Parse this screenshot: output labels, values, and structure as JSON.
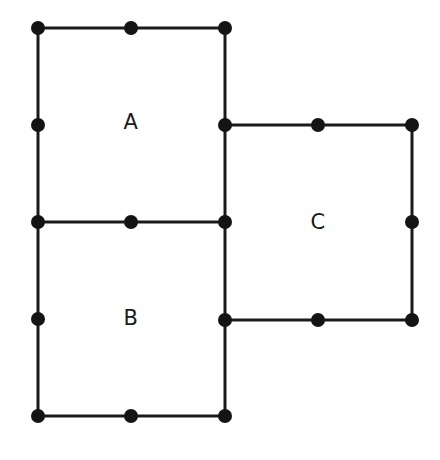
{
  "figure": {
    "background_color": "#ffffff",
    "line_color": "#1a1a1a",
    "dot_color": "#141414",
    "label_color": "#1a1a1a",
    "line_width": 3,
    "dot_radius": 7,
    "canvas": {
      "width": 440,
      "height": 460
    }
  },
  "squares": [
    {
      "id": "square-a",
      "label": "A",
      "x": 38,
      "y": 28,
      "size": 194,
      "label_x": 131,
      "label_y": 123
    },
    {
      "id": "square-b",
      "label": "B",
      "x": 38,
      "y": 222,
      "size": 194,
      "label_x": 131,
      "label_y": 319
    },
    {
      "id": "square-c",
      "label": "C",
      "x": 225,
      "y": 125,
      "size": 195,
      "label_x": 318,
      "label_y": 223
    }
  ],
  "segments": [
    {
      "name": "square-a-top-edge",
      "x1": 38,
      "y1": 28,
      "x2": 225,
      "y2": 28
    },
    {
      "name": "square-a-left-edge",
      "x1": 38,
      "y1": 28,
      "x2": 38,
      "y2": 222
    },
    {
      "name": "square-a-right-edge",
      "x1": 225,
      "y1": 28,
      "x2": 225,
      "y2": 222
    },
    {
      "name": "square-a-bottom-edge",
      "x1": 38,
      "y1": 222,
      "x2": 225,
      "y2": 222
    },
    {
      "name": "square-b-left-edge",
      "x1": 38,
      "y1": 222,
      "x2": 38,
      "y2": 416
    },
    {
      "name": "square-b-right-edge",
      "x1": 225,
      "y1": 222,
      "x2": 225,
      "y2": 416
    },
    {
      "name": "square-b-bottom-edge",
      "x1": 38,
      "y1": 416,
      "x2": 225,
      "y2": 416
    },
    {
      "name": "square-c-top-edge",
      "x1": 225,
      "y1": 125,
      "x2": 412,
      "y2": 125
    },
    {
      "name": "square-c-right-edge",
      "x1": 412,
      "y1": 125,
      "x2": 412,
      "y2": 320
    },
    {
      "name": "square-c-bottom-edge",
      "x1": 225,
      "y1": 320,
      "x2": 412,
      "y2": 320
    }
  ],
  "dots": [
    {
      "name": "vertex-a-top-left",
      "x": 38,
      "y": 28
    },
    {
      "name": "midpoint-a-top",
      "x": 131,
      "y": 28
    },
    {
      "name": "vertex-a-top-right",
      "x": 225,
      "y": 28
    },
    {
      "name": "midpoint-a-left",
      "x": 38,
      "y": 125
    },
    {
      "name": "junction-a-c-left",
      "x": 225,
      "y": 125
    },
    {
      "name": "midpoint-c-top",
      "x": 318,
      "y": 125
    },
    {
      "name": "vertex-c-top-right",
      "x": 412,
      "y": 125
    },
    {
      "name": "junction-a-b-left",
      "x": 38,
      "y": 222
    },
    {
      "name": "midpoint-ab-shared-edge",
      "x": 131,
      "y": 222
    },
    {
      "name": "junction-a-b-right",
      "x": 225,
      "y": 222
    },
    {
      "name": "midpoint-c-right",
      "x": 412,
      "y": 222
    },
    {
      "name": "midpoint-b-left",
      "x": 38,
      "y": 319
    },
    {
      "name": "junction-b-c-left",
      "x": 225,
      "y": 320
    },
    {
      "name": "midpoint-c-bottom",
      "x": 318,
      "y": 320
    },
    {
      "name": "vertex-c-bottom-right",
      "x": 412,
      "y": 320
    },
    {
      "name": "vertex-b-bottom-left",
      "x": 38,
      "y": 416
    },
    {
      "name": "midpoint-b-bottom",
      "x": 131,
      "y": 416
    },
    {
      "name": "vertex-b-bottom-right",
      "x": 225,
      "y": 416
    }
  ]
}
